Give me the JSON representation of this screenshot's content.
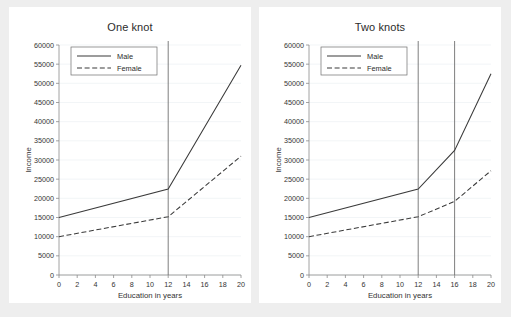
{
  "figure": {
    "background_color": "#eeeeee",
    "panel_background_color": "#ffffff",
    "line_color": "#3a3a3a",
    "knot_color": "#707070",
    "grid_color": "#e9eef2"
  },
  "chart_data": [
    {
      "type": "line",
      "title": "One knot",
      "xlabel": "Education in years",
      "ylabel": "Income",
      "xlim": [
        0,
        20
      ],
      "ylim": [
        0,
        60000
      ],
      "xticks": [
        0,
        2,
        4,
        6,
        8,
        10,
        12,
        14,
        16,
        18,
        20
      ],
      "xticklabels": [
        "0",
        "2",
        "4",
        "6",
        "8",
        "10",
        "12",
        "14",
        "16",
        "18",
        "20"
      ],
      "yticks": [
        0,
        5000,
        10000,
        15000,
        20000,
        25000,
        30000,
        35000,
        40000,
        45000,
        50000,
        55000,
        60000
      ],
      "yticklabels": [
        "0",
        "5000",
        "10000",
        "15000",
        "20000",
        "25000",
        "30000",
        "35000",
        "40000",
        "45000",
        "50000",
        "55000",
        "60000"
      ],
      "grid": true,
      "legend": [
        "Male",
        "Female"
      ],
      "legend_position": "upper left",
      "knots": [
        12
      ],
      "x": [
        0,
        12,
        20
      ],
      "series": [
        {
          "name": "Male",
          "style": "solid",
          "values": [
            15000,
            22400,
            54700
          ]
        },
        {
          "name": "Female",
          "style": "dashed",
          "values": [
            10000,
            15200,
            31000
          ]
        }
      ]
    },
    {
      "type": "line",
      "title": "Two knots",
      "xlabel": "Education in years",
      "ylabel": "Income",
      "xlim": [
        0,
        20
      ],
      "ylim": [
        0,
        60000
      ],
      "xticks": [
        0,
        2,
        4,
        6,
        8,
        10,
        12,
        14,
        16,
        18,
        20
      ],
      "xticklabels": [
        "0",
        "2",
        "4",
        "6",
        "8",
        "10",
        "12",
        "14",
        "16",
        "18",
        "20"
      ],
      "yticks": [
        0,
        5000,
        10000,
        15000,
        20000,
        25000,
        30000,
        35000,
        40000,
        45000,
        50000,
        55000,
        60000
      ],
      "yticklabels": [
        "0",
        "5000",
        "10000",
        "15000",
        "20000",
        "25000",
        "30000",
        "35000",
        "40000",
        "45000",
        "50000",
        "55000",
        "60000"
      ],
      "grid": true,
      "legend": [
        "Male",
        "Female"
      ],
      "legend_position": "upper left",
      "knots": [
        12,
        16
      ],
      "x": [
        0,
        12,
        16,
        20
      ],
      "series": [
        {
          "name": "Male",
          "style": "solid",
          "values": [
            15000,
            22400,
            32500,
            52500
          ]
        },
        {
          "name": "Female",
          "style": "dashed",
          "values": [
            10000,
            15200,
            19200,
            27200
          ]
        }
      ]
    }
  ],
  "panels": [
    {
      "title": "One knot",
      "xlabel": "Education in years",
      "ylabel": "Income",
      "legend": {
        "male": "Male",
        "female": "Female"
      }
    },
    {
      "title": "Two knots",
      "xlabel": "Education in years",
      "ylabel": "Income",
      "legend": {
        "male": "Male",
        "female": "Female"
      }
    }
  ]
}
